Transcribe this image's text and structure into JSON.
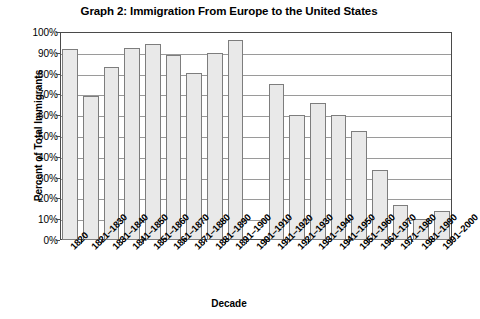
{
  "chart_data": {
    "type": "bar",
    "title": "Graph 2: Immigration From Europe to the United States",
    "xlabel": "Decade",
    "ylabel": "Percent of Total Immigrants",
    "ylim": [
      0,
      100
    ],
    "ytick_labels": [
      "100%",
      "90%",
      "80%",
      "70%",
      "60%",
      "50%",
      "40%",
      "30%",
      "20%",
      "10%",
      "0%"
    ],
    "ytick_values": [
      100,
      90,
      80,
      70,
      60,
      50,
      40,
      30,
      20,
      10,
      0
    ],
    "grid": true,
    "legend": "none",
    "categories": [
      "1820",
      "1821–1830",
      "1831–1840",
      "1841–1850",
      "1851–1860",
      "1861–1870",
      "1871–1880",
      "1881–1890",
      "1891–1900",
      "1901–1910",
      "1911–1920",
      "1921–1930",
      "1931–1940",
      "1941–1950",
      "1951–1960",
      "1961–1970",
      "1971–1980",
      "1981–1990",
      "1991–2000"
    ],
    "values": [
      92,
      69,
      83,
      92.5,
      94,
      89,
      80.5,
      90,
      96,
      0,
      75,
      60,
      66,
      60,
      52.5,
      33.5,
      17,
      10,
      14
    ],
    "bar_fill": "#e9e9e9",
    "bar_border": "#7d7d7d",
    "axis_color": "#4a4a4a",
    "grid_color": "#9a9a9a",
    "plot_background": "#ffffff"
  }
}
